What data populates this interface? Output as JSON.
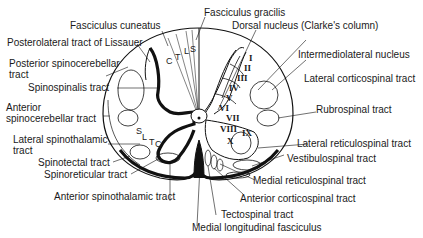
{
  "diagram": {
    "labels": {
      "fasciculus_gracilis": "Fasciculus gracilis",
      "fasciculus_cuneatus": "Fasciculus cuneatus",
      "dorsal_nucleus": "Dorsal nucleus (Clarke's column)",
      "posterolateral_tract": "Posterolateral tract of Lissauer",
      "posterior_spinocerebellar_1": "Posterior spinocerebellar",
      "posterior_spinocerebellar_2": "tract",
      "intermediolateral_nucleus": "Intermediolateral nucleus",
      "lateral_corticospinal": "Lateral corticospinal tract",
      "spinospinalis": "Spinospinalis tract",
      "rubrospinal": "Rubrospinal tract",
      "anterior_spinocerebellar_1": "Anterior",
      "anterior_spinocerebellar_2": "spinocerebellar tract",
      "lateral_spinothalamic_1": "Lateral spinothalamic",
      "lateral_spinothalamic_2": "tract",
      "lateral_reticulospinal": "Lateral reticulospinal tract",
      "spinotectal": "Spinotectal tract",
      "vestibulospinal": "Vestibulospinal tract",
      "spinoreticular": "Spinoreticular tract",
      "medial_reticulospinal": "Medial reticulospinal tract",
      "anterior_spinothalamic": "Anterior spinothalamic tract",
      "anterior_corticospinal": "Anterior corticospinal tract",
      "tectospinal": "Tectospinal tract",
      "medial_longitudinal": "Medial longitudinal fasciculus"
    },
    "segment_letters": {
      "dorsal": [
        "C",
        "T",
        "L",
        "S"
      ],
      "lateral": [
        "S",
        "L",
        "T",
        "C"
      ]
    },
    "laminae": [
      "I",
      "II",
      "III",
      "IV",
      "V",
      "VI",
      "VII",
      "VIII",
      "IX",
      "X"
    ]
  }
}
